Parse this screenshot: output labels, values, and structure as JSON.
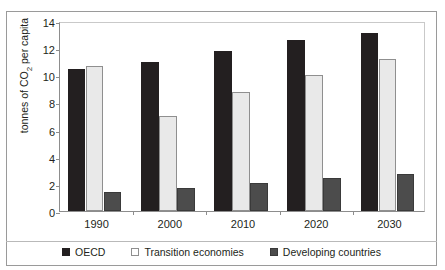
{
  "figure": {
    "title_partial": "",
    "y_axis_title_pre": "tonnes of CO",
    "y_axis_title_sub": "2",
    "y_axis_title_post": " per capita"
  },
  "legend": {
    "position": "bottom-center",
    "items": [
      {
        "label": "OECD",
        "color": "#231f20",
        "swatch": "filled-black-square"
      },
      {
        "label": "Transition economies",
        "color": "#e9e9e9",
        "swatch": "open-square"
      },
      {
        "label": "Developing countries",
        "color": "#4c4c4c",
        "swatch": "filled-gray-square"
      }
    ]
  },
  "chart_data": {
    "type": "bar",
    "title": "",
    "xlabel": "",
    "ylabel": "tonnes of CO2 per capita",
    "ylim": [
      0,
      14
    ],
    "yticks": [
      0,
      2,
      4,
      6,
      8,
      10,
      12,
      14
    ],
    "grid": false,
    "categories": [
      "1990",
      "2000",
      "2010",
      "2020",
      "2030"
    ],
    "series": [
      {
        "name": "OECD",
        "color": "#231f20",
        "values": [
          10.5,
          11.0,
          11.8,
          12.6,
          13.1
        ]
      },
      {
        "name": "Transition economies",
        "color": "#e9e9e9",
        "values": [
          10.7,
          7.0,
          8.8,
          10.0,
          11.2
        ]
      },
      {
        "name": "Developing countries",
        "color": "#4c4c4c",
        "values": [
          1.4,
          1.7,
          2.1,
          2.4,
          2.7
        ]
      }
    ]
  }
}
